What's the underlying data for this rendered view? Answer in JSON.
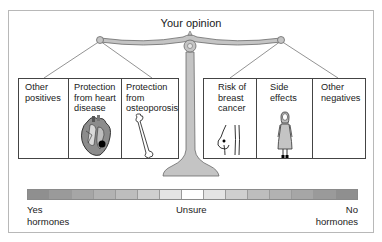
{
  "title": "Your opinion",
  "left_pan": {
    "cells": [
      {
        "label": "Other positives",
        "icon": "none"
      },
      {
        "label": "Protection from heart disease",
        "icon": "heart-icon"
      },
      {
        "label": "Protection from osteoporosis",
        "icon": "bone-icon"
      }
    ]
  },
  "right_pan": {
    "cells": [
      {
        "label": "Risk of breast cancer",
        "icon": "breast-icon"
      },
      {
        "label": "Side effects",
        "icon": "woman-figure-icon"
      },
      {
        "label": "Other negatives",
        "icon": "none"
      }
    ]
  },
  "scale_bar": {
    "segments": 15,
    "colors": [
      "#8f8f8f",
      "#9a9a9a",
      "#a6a6a6",
      "#b2b2b2",
      "#bdbdbd",
      "#cfcfcf",
      "#e4e4e4",
      "#ffffff",
      "#e4e4e4",
      "#cfcfcf",
      "#bdbdbd",
      "#b2b2b2",
      "#a6a6a6",
      "#9a9a9a",
      "#8f8f8f"
    ],
    "left_label_line1": "Yes",
    "left_label_line2": "hormones",
    "center_label": "Unsure",
    "right_label_line1": "No",
    "right_label_line2": "hormones"
  },
  "colors": {
    "scale_fill": "#c4c4c4",
    "scale_stroke": "#6a6a6a",
    "line": "#444444"
  }
}
